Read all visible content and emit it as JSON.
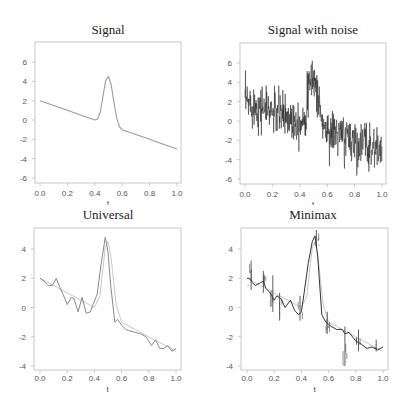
{
  "figure": {
    "panels": [
      {
        "id": "signal",
        "title": "Signal",
        "xlabel": "t",
        "yticks": [
          -6,
          -4,
          -2,
          0,
          2,
          4,
          6
        ],
        "xticks": [
          "0.0",
          "0.2",
          "0.4",
          "0.6",
          "0.8",
          "1.0"
        ]
      },
      {
        "id": "noisy",
        "title": "Signal with noise",
        "xlabel": "t",
        "yticks": [
          -6,
          -4,
          -2,
          0,
          2,
          4,
          6
        ],
        "xticks": [
          "0.0",
          "0.2",
          "0.4",
          "0.6",
          "0.8",
          "1.0"
        ]
      },
      {
        "id": "universal",
        "title": "Universal",
        "xlabel": "t",
        "yticks": [
          -4,
          -2,
          0,
          2,
          4
        ],
        "xticks": [
          "0.0",
          "0.2",
          "0.4",
          "0.6",
          "0.8",
          "1.0"
        ]
      },
      {
        "id": "minimax",
        "title": "Minimax",
        "xlabel": "t",
        "yticks": [
          -4,
          -2,
          0,
          2,
          4
        ],
        "xticks": [
          "0.0",
          "0.2",
          "0.4",
          "0.6",
          "0.8",
          "1.0"
        ]
      }
    ]
  },
  "chart_data": [
    {
      "type": "line",
      "title": "Signal",
      "xlabel": "t",
      "ylabel": "",
      "xlim": [
        0,
        1
      ],
      "ylim": [
        -7,
        7.5
      ],
      "series": [
        {
          "name": "signal",
          "color": "#9a9a9a",
          "x": [
            0.0,
            0.1,
            0.2,
            0.3,
            0.4,
            0.42,
            0.44,
            0.46,
            0.48,
            0.5,
            0.52,
            0.54,
            0.56,
            0.58,
            0.6,
            0.7,
            0.8,
            0.9,
            1.0
          ],
          "y": [
            2.0,
            1.5,
            1.0,
            0.5,
            0.0,
            0.1,
            0.8,
            2.5,
            4.1,
            4.5,
            3.6,
            1.8,
            0.2,
            -0.7,
            -1.0,
            -1.5,
            -2.0,
            -2.5,
            -3.0
          ]
        }
      ]
    },
    {
      "type": "line",
      "title": "Signal with noise",
      "xlabel": "t",
      "ylabel": "",
      "xlim": [
        0,
        1
      ],
      "ylim": [
        -7,
        7.5
      ],
      "series": [
        {
          "name": "noisy signal",
          "color": "#222222",
          "noise_sd": 1.0,
          "x": [
            0.0,
            0.1,
            0.2,
            0.3,
            0.4,
            0.42,
            0.44,
            0.46,
            0.48,
            0.5,
            0.52,
            0.54,
            0.56,
            0.58,
            0.6,
            0.7,
            0.8,
            0.9,
            1.0
          ],
          "y": [
            2.0,
            1.5,
            1.0,
            0.5,
            0.0,
            0.1,
            0.8,
            2.5,
            4.1,
            4.5,
            3.6,
            1.8,
            0.2,
            -0.7,
            -1.0,
            -1.5,
            -2.0,
            -2.5,
            -3.0
          ],
          "range_observed": [
            -6.2,
            7.3
          ]
        }
      ]
    },
    {
      "type": "line",
      "title": "Universal",
      "xlabel": "t",
      "ylabel": "",
      "xlim": [
        0,
        1
      ],
      "ylim": [
        -4.3,
        5.3
      ],
      "series": [
        {
          "name": "true signal",
          "color": "#c8c8c8",
          "x": [
            0.0,
            0.1,
            0.2,
            0.3,
            0.4,
            0.44,
            0.48,
            0.5,
            0.52,
            0.56,
            0.6,
            0.7,
            0.8,
            0.9,
            1.0
          ],
          "y": [
            2.0,
            1.5,
            1.0,
            0.5,
            0.0,
            0.8,
            4.1,
            4.5,
            3.6,
            0.2,
            -1.0,
            -1.5,
            -2.0,
            -2.5,
            -3.0
          ]
        },
        {
          "name": "universal threshold estimate",
          "color": "#888888",
          "x": [
            0.0,
            0.03,
            0.06,
            0.09,
            0.12,
            0.14,
            0.17,
            0.2,
            0.23,
            0.25,
            0.28,
            0.31,
            0.34,
            0.37,
            0.39,
            0.42,
            0.45,
            0.48,
            0.5,
            0.52,
            0.55,
            0.57,
            0.6,
            0.63,
            0.66,
            0.7,
            0.74,
            0.78,
            0.82,
            0.85,
            0.88,
            0.91,
            0.94,
            0.97,
            1.0
          ],
          "y": [
            2.0,
            1.8,
            1.5,
            1.5,
            2.0,
            1.5,
            0.9,
            0.2,
            0.7,
            0.6,
            -0.3,
            0.7,
            -0.4,
            -0.3,
            0.2,
            0.9,
            3.0,
            4.8,
            3.8,
            1.5,
            -1.0,
            -0.8,
            -1.2,
            -1.5,
            -1.6,
            -1.7,
            -1.8,
            -2.0,
            -2.6,
            -2.2,
            -2.8,
            -2.8,
            -2.6,
            -3.0,
            -2.8
          ]
        }
      ]
    },
    {
      "type": "line",
      "title": "Minimax",
      "xlabel": "t",
      "ylabel": "",
      "xlim": [
        0,
        1
      ],
      "ylim": [
        -4.3,
        5.3
      ],
      "series": [
        {
          "name": "true signal",
          "color": "#c8c8c8",
          "x": [
            0.0,
            0.1,
            0.2,
            0.3,
            0.4,
            0.44,
            0.48,
            0.5,
            0.52,
            0.56,
            0.6,
            0.7,
            0.8,
            0.9,
            1.0
          ],
          "y": [
            2.0,
            1.5,
            1.0,
            0.5,
            0.0,
            0.8,
            4.1,
            4.5,
            3.6,
            0.2,
            -1.0,
            -1.5,
            -2.0,
            -2.5,
            -3.0
          ]
        },
        {
          "name": "minimax threshold estimate",
          "color": "#333333",
          "x": [
            0.0,
            0.02,
            0.04,
            0.06,
            0.1,
            0.12,
            0.14,
            0.17,
            0.2,
            0.22,
            0.25,
            0.28,
            0.32,
            0.35,
            0.38,
            0.4,
            0.42,
            0.45,
            0.48,
            0.5,
            0.52,
            0.55,
            0.58,
            0.62,
            0.66,
            0.7,
            0.72,
            0.75,
            0.8,
            0.84,
            0.88,
            0.92,
            0.96,
            1.0
          ],
          "y": [
            2.0,
            2.0,
            1.7,
            1.5,
            1.7,
            1.8,
            1.3,
            1.0,
            0.5,
            0.8,
            0.6,
            0.0,
            0.5,
            -0.2,
            -0.5,
            -0.3,
            1.0,
            3.0,
            4.5,
            4.9,
            3.5,
            -0.5,
            -1.0,
            -1.3,
            -1.5,
            -1.5,
            -1.8,
            -1.7,
            -2.3,
            -2.5,
            -2.8,
            -2.7,
            -2.9,
            -2.7
          ],
          "spikes": [
            {
              "x": 0.03,
              "lo": 1.2,
              "hi": 3.2
            },
            {
              "x": 0.12,
              "lo": 1.0,
              "hi": 2.5
            },
            {
              "x": 0.19,
              "lo": -0.3,
              "hi": 2.2
            },
            {
              "x": 0.24,
              "lo": -0.9,
              "hi": 1.0
            },
            {
              "x": 0.39,
              "lo": -0.9,
              "hi": 0.8
            },
            {
              "x": 0.51,
              "lo": 4.2,
              "hi": 5.3
            },
            {
              "x": 0.59,
              "lo": -1.8,
              "hi": -0.3
            },
            {
              "x": 0.72,
              "lo": -4.0,
              "hi": -1.3
            },
            {
              "x": 0.82,
              "lo": -3.0,
              "hi": -1.5
            },
            {
              "x": 0.95,
              "lo": -3.0,
              "hi": -2.2
            }
          ]
        }
      ]
    }
  ]
}
